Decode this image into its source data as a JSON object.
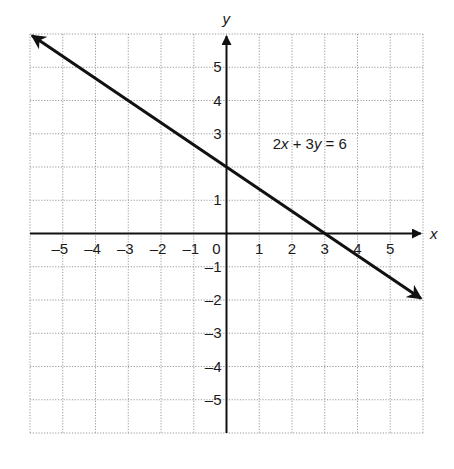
{
  "chart_data": {
    "type": "line",
    "title": "",
    "xlabel": "x",
    "ylabel": "y",
    "xlim": [
      -6,
      6
    ],
    "ylim": [
      -6,
      6
    ],
    "grid": true,
    "grid_style": "dotted",
    "x_tick_labels": [
      "-5",
      "-4",
      "-3",
      "-2",
      "-1",
      "0",
      "1",
      "2",
      "3",
      "4",
      "5"
    ],
    "y_tick_labels": [
      "5",
      "4",
      "3",
      "1",
      "-1",
      "-2",
      "-3",
      "-4",
      "-5"
    ],
    "series": [
      {
        "name": "2x + 3y = 6",
        "equation": "2x + 3y = 6",
        "slope": -0.6667,
        "y_intercept": 2,
        "x_intercept": 3,
        "points": [
          [
            -6,
            6
          ],
          [
            0,
            2
          ],
          [
            3,
            0
          ],
          [
            6,
            -2
          ]
        ],
        "arrows": "both"
      }
    ],
    "annotations": [
      {
        "text": "2x + 3y = 6",
        "x": 1.5,
        "y": 2.55
      }
    ]
  },
  "labels": {
    "x_axis": "x",
    "y_axis": "y",
    "equation_prefix": "2",
    "equation_x": "x",
    "equation_mid": " + 3",
    "equation_y": "y",
    "equation_suffix": " = 6"
  },
  "colors": {
    "grid": "#9a9a9a",
    "axis": "#111111",
    "line": "#111111",
    "background": "#ffffff"
  }
}
